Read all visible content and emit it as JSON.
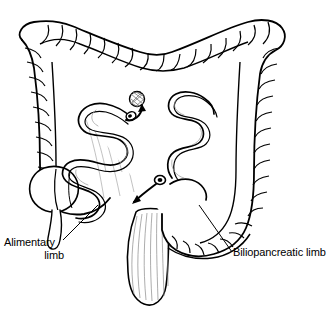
{
  "figure": {
    "style": "black and white line drawing",
    "background_color": "#ffffff",
    "ink_color": "#000000",
    "shading_color": "#8a8a8a"
  },
  "labels": {
    "alimentary": {
      "line1": "Alimentary",
      "line2": "limb"
    },
    "biliopancreatic": {
      "text": "Biliopancreatic limb"
    }
  },
  "annotations": {
    "upper_anastomosis": {
      "name": "upper anastomosis",
      "arrow_direction": "up-right"
    },
    "lower_anastomosis": {
      "name": "lower anastomosis",
      "arrow_direction": "down-left"
    }
  },
  "anatomy": [
    "transverse colon",
    "ascending colon",
    "descending colon",
    "cecum",
    "appendix",
    "sigmoid colon",
    "rectum",
    "alimentary limb",
    "biliopancreatic limb",
    "mesentery"
  ]
}
